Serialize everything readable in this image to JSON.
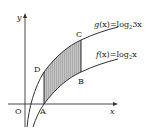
{
  "diagram": {
    "axes": {
      "x_label": "x",
      "y_label": "y",
      "origin_label": "O"
    },
    "curves": [
      {
        "name": "g",
        "label_fn": "g",
        "label_arg": "(x)",
        "label_eq": "=log",
        "label_sub": "2",
        "label_rest": "3x"
      },
      {
        "name": "f",
        "label_fn": "f",
        "label_arg": "(x)",
        "label_eq": "=log",
        "label_sub": "2",
        "label_rest": "x"
      }
    ],
    "points": {
      "A": "A",
      "B": "B",
      "C": "C",
      "D": "D"
    },
    "colors": {
      "line": "#333333",
      "shade": "#b8b8b8"
    }
  }
}
